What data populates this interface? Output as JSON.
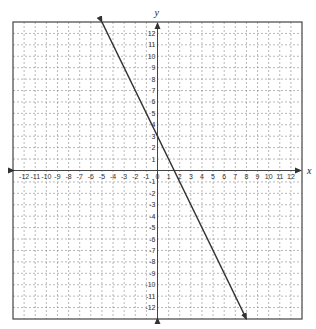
{
  "chart_data": {
    "type": "line",
    "title": "",
    "xlabel": "x",
    "ylabel": "y",
    "xlim": [
      -13,
      13
    ],
    "ylim": [
      -13,
      13
    ],
    "grid": true,
    "x_ticks": [
      -12,
      -11,
      -10,
      -9,
      -8,
      -7,
      -6,
      -5,
      -4,
      -3,
      -2,
      -1,
      0,
      1,
      2,
      3,
      4,
      5,
      6,
      7,
      8,
      9,
      10,
      11,
      12
    ],
    "y_ticks": [
      -12,
      -11,
      -10,
      -9,
      -8,
      -7,
      -6,
      -5,
      -4,
      -3,
      -2,
      -1,
      1,
      2,
      3,
      4,
      5,
      6,
      7,
      8,
      9,
      10,
      11,
      12
    ],
    "series": [
      {
        "name": "line",
        "equation": "y = -2x + 3",
        "slope": -2,
        "intercept": 3,
        "x": [
          -5,
          8
        ],
        "y": [
          13,
          -13
        ],
        "arrows": "both",
        "color": "#333333"
      }
    ]
  }
}
